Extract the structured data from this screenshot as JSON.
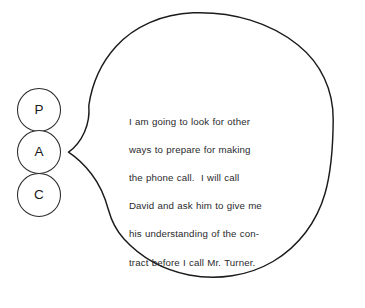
{
  "canvas": {
    "width": 365,
    "height": 308,
    "background_color": "#ffffff"
  },
  "diagram": {
    "type": "pac-ego-state-speech-bubble",
    "stroke_color": "#1b1b1b",
    "text_color": "#2a2a2c"
  },
  "ego_states": {
    "label": "PAC ego state column",
    "circles": [
      {
        "letter": "P",
        "name": "parent-circle",
        "cx": 39,
        "cy": 110,
        "r": 21.5
      },
      {
        "letter": "A",
        "name": "adult-circle",
        "cx": 39,
        "cy": 152,
        "r": 21.5
      },
      {
        "letter": "C",
        "name": "child-circle",
        "cx": 39,
        "cy": 195,
        "r": 21.5
      }
    ]
  },
  "speech_bubble": {
    "name": "speech-bubble",
    "tail_anchor": "adult-circle",
    "lines": [
      "I am going to look for other",
      "ways to prepare for making",
      "the phone call.  I will call",
      "David and ask him to give me",
      "his understanding of the con-",
      "tract before I call Mr. Turner."
    ],
    "full_text": "I am going to look for other ways to prepare for making the phone call. I will call David and ask him to give me his understanding of the contract before I call Mr. Turner."
  }
}
